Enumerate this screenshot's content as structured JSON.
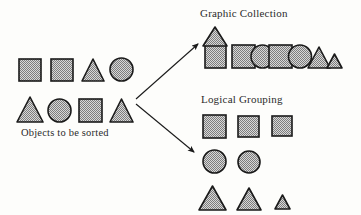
{
  "figure": {
    "width": 361,
    "height": 215,
    "background": "#fdfdfb",
    "shape_fill": "#9a9a9a",
    "shape_stroke": "#1a1a1a",
    "text_color": "#2b2b2b",
    "arrow_color": "#1a1a1a"
  },
  "titles": {
    "graphic_collection": "Graphic Collection",
    "logical_grouping": "Logical Grouping"
  },
  "captions": {
    "objects_to_be_sorted": "Objects to be sorted"
  },
  "source_group": {
    "caption": "Objects to be sorted",
    "row1": [
      {
        "shape": "square",
        "x": 19,
        "y": 59,
        "w": 22,
        "h": 22
      },
      {
        "shape": "square",
        "x": 51,
        "y": 59,
        "w": 22,
        "h": 22
      },
      {
        "shape": "triangle",
        "x": 82,
        "y": 59,
        "w": 22,
        "h": 22
      },
      {
        "shape": "circle",
        "x": 110,
        "y": 58,
        "w": 23,
        "h": 23
      }
    ],
    "row2": [
      {
        "shape": "triangle",
        "x": 17,
        "y": 97,
        "w": 26,
        "h": 25
      },
      {
        "shape": "circle",
        "x": 48,
        "y": 99,
        "w": 23,
        "h": 23
      },
      {
        "shape": "square",
        "x": 79,
        "y": 99,
        "w": 23,
        "h": 23
      },
      {
        "shape": "triangle",
        "x": 110,
        "y": 99,
        "w": 23,
        "h": 23
      }
    ]
  },
  "arrows": [
    {
      "name": "arrow-to-graphic-collection",
      "x1": 133,
      "y1": 99,
      "x2": 199,
      "y2": 43,
      "direction": "up-right"
    },
    {
      "name": "arrow-to-logical-grouping",
      "x1": 133,
      "y1": 103,
      "x2": 196,
      "y2": 154,
      "direction": "down-right"
    }
  ],
  "graphic_collection": {
    "title": "Graphic Collection",
    "house": {
      "roof": {
        "shape": "triangle",
        "x": 203,
        "y": 27,
        "w": 24,
        "h": 19
      },
      "body": {
        "shape": "square",
        "x": 205,
        "y": 45,
        "w": 21,
        "h": 23
      }
    },
    "strip": [
      {
        "shape": "square",
        "x": 232,
        "y": 45,
        "w": 23,
        "h": 23
      },
      {
        "shape": "circle",
        "x": 251,
        "y": 45,
        "w": 23,
        "h": 23
      },
      {
        "shape": "square",
        "x": 269,
        "y": 45,
        "w": 23,
        "h": 23
      },
      {
        "shape": "circle",
        "x": 288,
        "y": 45,
        "w": 24,
        "h": 24
      },
      {
        "shape": "triangle",
        "x": 308,
        "y": 48,
        "w": 22,
        "h": 21
      },
      {
        "shape": "triangle",
        "x": 327,
        "y": 54,
        "w": 15,
        "h": 15
      }
    ]
  },
  "logical_grouping": {
    "title": "Logical Grouping",
    "squares": [
      {
        "shape": "square",
        "x": 203,
        "y": 115,
        "w": 23,
        "h": 23
      },
      {
        "shape": "square",
        "x": 238,
        "y": 116,
        "w": 21,
        "h": 21
      },
      {
        "shape": "square",
        "x": 272,
        "y": 116,
        "w": 20,
        "h": 20
      }
    ],
    "circles": [
      {
        "shape": "circle",
        "x": 203,
        "y": 150,
        "w": 23,
        "h": 23
      },
      {
        "shape": "circle",
        "x": 238,
        "y": 151,
        "w": 22,
        "h": 22
      }
    ],
    "triangles": [
      {
        "shape": "triangle",
        "x": 199,
        "y": 186,
        "w": 27,
        "h": 24
      },
      {
        "shape": "triangle",
        "x": 237,
        "y": 188,
        "w": 24,
        "h": 22
      },
      {
        "shape": "triangle",
        "x": 275,
        "y": 195,
        "w": 15,
        "h": 14
      }
    ]
  }
}
